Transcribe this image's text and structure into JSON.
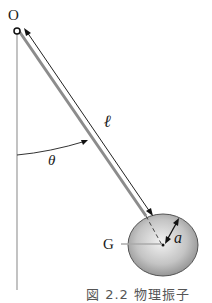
{
  "figure": {
    "labels": {
      "pivot": "O",
      "length": "ℓ",
      "angle": "θ",
      "center_of_mass": "G",
      "radius": "a"
    },
    "caption": "図 2.2 物理振子",
    "colors": {
      "rod": "#9a9a9a",
      "line": "#222222",
      "ball_light": "#eeeeee",
      "ball_dark": "#8f8f8f",
      "vertical": "#999999"
    }
  }
}
